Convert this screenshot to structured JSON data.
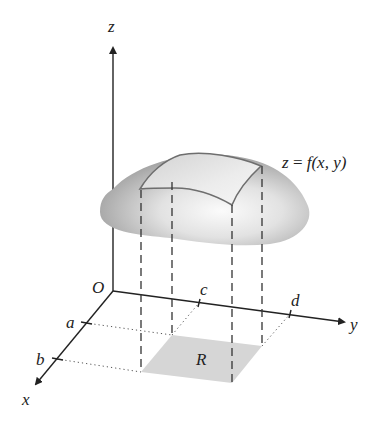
{
  "figure": {
    "axes": {
      "z_label": "z",
      "x_label": "x",
      "y_label": "y",
      "origin_label": "O"
    },
    "ticks": {
      "a": "a",
      "b": "b",
      "c": "c",
      "d": "d"
    },
    "surface_label": {
      "lhs": "z",
      "eq": " = ",
      "rhs": "f(x, y)"
    },
    "region_label": "R",
    "colors": {
      "axis": "#222222",
      "region_fill": "#d6d6d6",
      "surface_dark": "#9a9a9a",
      "surface_light": "#f4f4f4",
      "patch_outline": "#6e6e6e"
    }
  }
}
